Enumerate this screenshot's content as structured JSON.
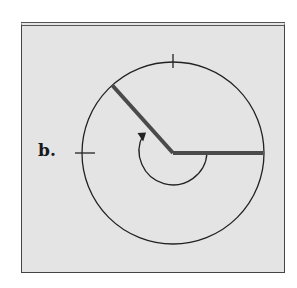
{
  "figure": {
    "label": "b.",
    "center": [
      173,
      153
    ],
    "outer_radius": 91,
    "inner_arc_radius": 34,
    "initial_side_angle_deg": 0,
    "terminal_side_angle_deg": 132,
    "rotation": "counterclockwise",
    "tick_marks": [
      "top",
      "left"
    ],
    "colors": {
      "background": "#e4e4e4",
      "line": "#222222",
      "ray": "#4a4a4a",
      "frame": "#444444"
    }
  }
}
